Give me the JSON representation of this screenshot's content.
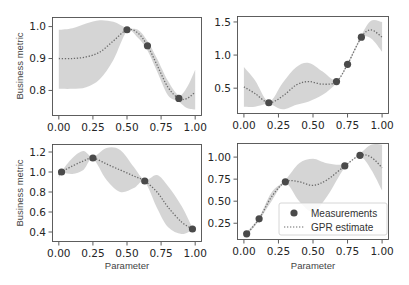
{
  "figure": {
    "x_label": "Parameter",
    "y_label": "Business metric",
    "legend": {
      "measurements_label": "Measurements",
      "gpr_label": "GPR estimate"
    },
    "colors": {
      "band": "#d3d3d3",
      "mean_line": "#6b6b6b",
      "marker": "#4a4a4a",
      "frame": "#4d4d4d"
    }
  },
  "chart_data": [
    {
      "type": "line",
      "panel": "top-left",
      "title": "",
      "xlabel": "",
      "ylabel": "Business metric",
      "xlim": [
        -0.05,
        1.05
      ],
      "ylim": [
        0.72,
        1.03
      ],
      "xticks": [
        "0.00",
        "0.25",
        "0.50",
        "0.75",
        "1.00"
      ],
      "yticks": [
        "0.8",
        "0.9",
        "1.0"
      ],
      "grid": false,
      "measurements": {
        "x": [
          0.5,
          0.65,
          0.88
        ],
        "y": [
          0.99,
          0.94,
          0.775
        ]
      },
      "gpr_mean": {
        "x": [
          0.0,
          0.1,
          0.2,
          0.3,
          0.4,
          0.5,
          0.58,
          0.65,
          0.72,
          0.8,
          0.88,
          0.94,
          1.0
        ],
        "y": [
          0.9,
          0.9,
          0.905,
          0.92,
          0.955,
          0.99,
          0.98,
          0.94,
          0.88,
          0.81,
          0.775,
          0.775,
          0.795
        ]
      },
      "gpr_upper": [
        0.99,
        0.995,
        1.01,
        1.02,
        1.015,
        0.995,
        0.99,
        0.955,
        0.9,
        0.83,
        0.785,
        0.81,
        0.865
      ],
      "gpr_lower": [
        0.805,
        0.805,
        0.81,
        0.835,
        0.895,
        0.985,
        0.965,
        0.925,
        0.86,
        0.785,
        0.765,
        0.745,
        0.74
      ]
    },
    {
      "type": "line",
      "panel": "top-right",
      "title": "",
      "xlabel": "",
      "ylabel": "",
      "xlim": [
        -0.05,
        1.05
      ],
      "ylim": [
        0.11,
        1.59
      ],
      "xticks": [
        "0.00",
        "0.25",
        "0.50",
        "0.75",
        "1.00"
      ],
      "yticks": [
        "0.5",
        "1.0",
        "1.5"
      ],
      "grid": false,
      "measurements": {
        "x": [
          0.18,
          0.67,
          0.75,
          0.85
        ],
        "y": [
          0.28,
          0.6,
          0.86,
          1.27
        ]
      },
      "gpr_mean": {
        "x": [
          0.0,
          0.08,
          0.18,
          0.28,
          0.38,
          0.47,
          0.57,
          0.67,
          0.75,
          0.85,
          0.92,
          1.0
        ],
        "y": [
          0.52,
          0.42,
          0.28,
          0.38,
          0.55,
          0.6,
          0.56,
          0.6,
          0.86,
          1.27,
          1.38,
          1.27
        ]
      },
      "gpr_upper": [
        0.82,
        0.62,
        0.3,
        0.58,
        0.82,
        0.88,
        0.75,
        0.62,
        0.88,
        1.3,
        1.52,
        1.5
      ],
      "gpr_lower": [
        0.22,
        0.22,
        0.26,
        0.18,
        0.25,
        0.3,
        0.4,
        0.58,
        0.84,
        1.24,
        1.25,
        1.05
      ]
    },
    {
      "type": "line",
      "panel": "bottom-left",
      "title": "",
      "xlabel": "Parameter",
      "ylabel": "Business metric",
      "xlim": [
        -0.05,
        1.05
      ],
      "ylim": [
        0.3,
        1.28
      ],
      "xticks": [
        "0.00",
        "0.25",
        "0.50",
        "0.75",
        "1.00"
      ],
      "yticks": [
        "0.4",
        "0.6",
        "0.8",
        "1.0",
        "1.2"
      ],
      "grid": false,
      "measurements": {
        "x": [
          0.02,
          0.25,
          0.63,
          0.98
        ],
        "y": [
          1.0,
          1.14,
          0.91,
          0.43
        ]
      },
      "gpr_mean": {
        "x": [
          0.0,
          0.02,
          0.1,
          0.18,
          0.25,
          0.35,
          0.45,
          0.55,
          0.63,
          0.72,
          0.8,
          0.9,
          0.98
        ],
        "y": [
          0.97,
          1.0,
          1.06,
          1.11,
          1.14,
          1.08,
          1.02,
          0.96,
          0.91,
          0.8,
          0.65,
          0.5,
          0.43
        ]
      },
      "gpr_upper": [
        1.0,
        1.01,
        1.14,
        1.21,
        1.15,
        1.24,
        1.22,
        1.05,
        0.92,
        0.97,
        0.86,
        0.66,
        0.44
      ],
      "gpr_lower": [
        0.93,
        0.99,
        0.98,
        1.02,
        1.13,
        0.92,
        0.8,
        0.84,
        0.9,
        0.64,
        0.45,
        0.38,
        0.42
      ]
    },
    {
      "type": "line",
      "panel": "bottom-right",
      "title": "",
      "xlabel": "Parameter",
      "ylabel": "",
      "xlim": [
        -0.05,
        1.05
      ],
      "ylim": [
        0.06,
        1.16
      ],
      "xticks": [
        "0.00",
        "0.25",
        "0.50",
        "0.75",
        "1.00"
      ],
      "yticks": [
        "0.25",
        "0.50",
        "0.75",
        "1.00"
      ],
      "grid": false,
      "measurements": {
        "x": [
          0.02,
          0.11,
          0.3,
          0.73,
          0.84
        ],
        "y": [
          0.13,
          0.3,
          0.72,
          0.9,
          1.02
        ]
      },
      "gpr_mean": {
        "x": [
          0.0,
          0.02,
          0.11,
          0.2,
          0.3,
          0.4,
          0.5,
          0.6,
          0.73,
          0.84,
          0.92,
          1.0
        ],
        "y": [
          0.11,
          0.13,
          0.3,
          0.55,
          0.72,
          0.72,
          0.68,
          0.74,
          0.9,
          1.02,
          1.0,
          0.88
        ]
      },
      "gpr_upper": [
        0.14,
        0.15,
        0.32,
        0.6,
        0.74,
        0.93,
        0.98,
        0.93,
        0.92,
        1.04,
        1.14,
        1.14
      ],
      "gpr_lower": [
        0.09,
        0.11,
        0.28,
        0.5,
        0.7,
        0.5,
        0.38,
        0.55,
        0.88,
        1.0,
        0.86,
        0.62
      ]
    }
  ]
}
